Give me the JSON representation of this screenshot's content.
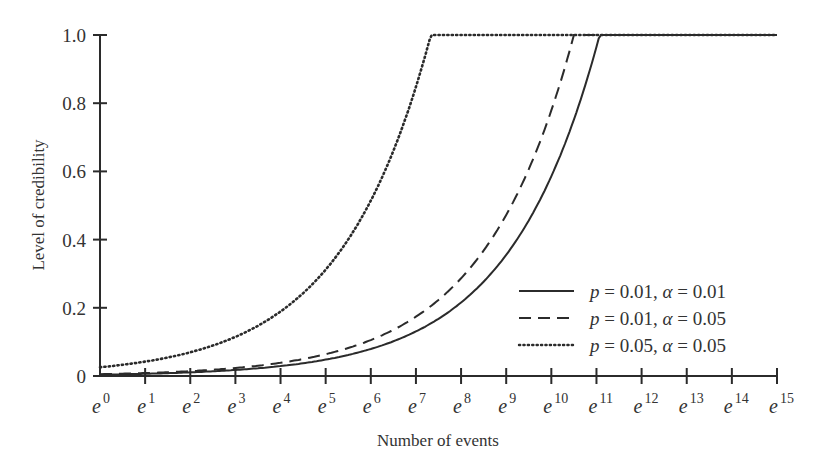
{
  "chart_data": {
    "type": "line",
    "title": "",
    "xlabel": "Number of events",
    "ylabel": "Level of credibility",
    "x_scale": "log (natural), ticks at e^k",
    "xlim": [
      0,
      15
    ],
    "ylim": [
      0,
      1.0
    ],
    "grid": false,
    "legend_position": "lower right (inside plot)",
    "x_ticks": [
      "e^0",
      "e^1",
      "e^2",
      "e^3",
      "e^4",
      "e^5",
      "e^6",
      "e^7",
      "e^8",
      "e^9",
      "e^10",
      "e^11",
      "e^12",
      "e^13",
      "e^14",
      "e^15"
    ],
    "x_tick_exponents": [
      "0",
      "1",
      "2",
      "3",
      "4",
      "5",
      "6",
      "7",
      "8",
      "9",
      "10",
      "11",
      "12",
      "13",
      "14",
      "15"
    ],
    "y_ticks": [
      "0",
      "0.2",
      "0.4",
      "0.6",
      "0.8",
      "1.0"
    ],
    "x": [
      0,
      1,
      2,
      3,
      4,
      5,
      6,
      7,
      8,
      9,
      10,
      11,
      12,
      13,
      14,
      15
    ],
    "series": [
      {
        "name": "p = 0.01, α = 0.01",
        "style": "solid",
        "full_credibility_at_ln_n": 11.07,
        "values": [
          0.004,
          0.007,
          0.011,
          0.018,
          0.03,
          0.05,
          0.08,
          0.13,
          0.22,
          0.36,
          0.59,
          0.97,
          1.0,
          1.0,
          1.0,
          1.0
        ]
      },
      {
        "name": "p = 0.01, α = 0.05",
        "style": "dashed",
        "full_credibility_at_ln_n": 10.5,
        "values": [
          0.005,
          0.009,
          0.014,
          0.024,
          0.04,
          0.065,
          0.105,
          0.17,
          0.29,
          0.47,
          0.78,
          1.0,
          1.0,
          1.0,
          1.0,
          1.0
        ]
      },
      {
        "name": "p = 0.05, α = 0.05",
        "style": "dotted",
        "full_credibility_at_ln_n": 7.33,
        "values": [
          0.026,
          0.042,
          0.07,
          0.115,
          0.19,
          0.31,
          0.52,
          0.85,
          1.0,
          1.0,
          1.0,
          1.0,
          1.0,
          1.0,
          1.0,
          1.0
        ]
      }
    ]
  },
  "legend": {
    "items": [
      {
        "p_sym": "p",
        "p_val": "= 0.01,",
        "a_sym": "α",
        "a_val": "= 0.01"
      },
      {
        "p_sym": "p",
        "p_val": "= 0.01,",
        "a_sym": "α",
        "a_val": "= 0.05"
      },
      {
        "p_sym": "p",
        "p_val": "= 0.05,",
        "a_sym": "α",
        "a_val": "= 0.05"
      }
    ]
  },
  "colors": {
    "ink": "#2b2b2b",
    "background": "#ffffff"
  }
}
